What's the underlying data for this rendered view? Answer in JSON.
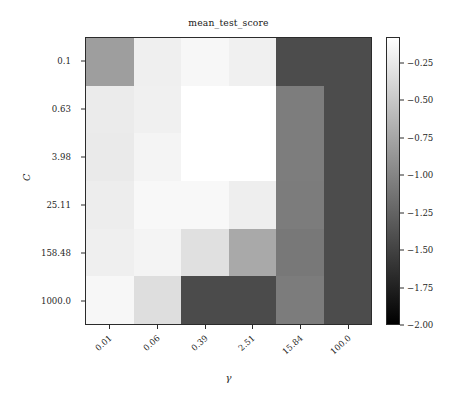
{
  "chart_data": {
    "type": "heatmap",
    "title": "mean_test_score",
    "xlabel": "γ",
    "ylabel": "C",
    "x_tick_labels": [
      "0.01",
      "0.06",
      "0.39",
      "2.51",
      "15.84",
      "100.0"
    ],
    "y_tick_labels": [
      "0.1",
      "0.63",
      "3.98",
      "25.11",
      "158.48",
      "1000.0"
    ],
    "x_values": [
      0.01,
      0.06,
      0.39,
      2.51,
      15.84,
      100.0
    ],
    "y_values": [
      0.1,
      0.63,
      3.98,
      25.11,
      158.48,
      1000.0
    ],
    "colormap": "gray",
    "grid": false,
    "legend": "colorbar-right",
    "vmin": -2.0,
    "vmax": -0.08,
    "colorbar": {
      "ticks": [
        -0.25,
        -0.5,
        -0.75,
        -1.0,
        -1.25,
        -1.5,
        -1.75,
        -2.0
      ],
      "tick_labels": [
        "−0.25",
        "−0.50",
        "−0.75",
        "−1.00",
        "−1.25",
        "−1.50",
        "−1.75",
        "−2.00"
      ],
      "top_color": "#ffffff",
      "bottom_color": "#000000"
    },
    "rows": [
      {
        "row_label": "0.1",
        "values": [
          -0.57,
          -0.18,
          -0.12,
          -0.17,
          -0.93,
          -0.93
        ],
        "colors": [
          "#9e9e9e",
          "#efefef",
          "#f7f7f7",
          "#f0f0f0",
          "#4c4c4c",
          "#4c4c4c"
        ]
      },
      {
        "row_label": "0.63",
        "values": [
          -0.22,
          -0.17,
          -0.08,
          -0.08,
          -0.71,
          -0.93
        ],
        "colors": [
          "#ebebeb",
          "#f0f0f0",
          "#ffffff",
          "#ffffff",
          "#7d7d7d",
          "#4c4c4c"
        ]
      },
      {
        "row_label": "3.98",
        "values": [
          -0.23,
          -0.14,
          -0.08,
          -0.08,
          -0.71,
          -0.93
        ],
        "colors": [
          "#eaeaea",
          "#f4f4f4",
          "#ffffff",
          "#ffffff",
          "#7d7d7d",
          "#4c4c4c"
        ]
      },
      {
        "row_label": "25.11",
        "values": [
          -0.2,
          -0.11,
          -0.11,
          -0.19,
          -0.72,
          -0.93
        ],
        "colors": [
          "#ededed",
          "#f8f8f8",
          "#f8f8f8",
          "#eeeeee",
          "#7c7c7c",
          "#4c4c4c"
        ]
      },
      {
        "row_label": "158.48",
        "values": [
          -0.18,
          -0.14,
          -0.29,
          -0.48,
          -0.76,
          -0.93
        ],
        "colors": [
          "#efefef",
          "#f4f4f4",
          "#e0e0e0",
          "#a9a9a9",
          "#787878",
          "#4c4c4c"
        ]
      },
      {
        "row_label": "1000.0",
        "values": [
          -0.12,
          -0.31,
          -0.94,
          -0.94,
          -0.72,
          -0.93
        ],
        "colors": [
          "#f7f7f7",
          "#dedede",
          "#4b4b4b",
          "#4b4b4b",
          "#7c7c7c",
          "#4c4c4c"
        ]
      }
    ]
  },
  "figure": {
    "background": "#ffffff",
    "axis_color": "#2b2b2b"
  }
}
